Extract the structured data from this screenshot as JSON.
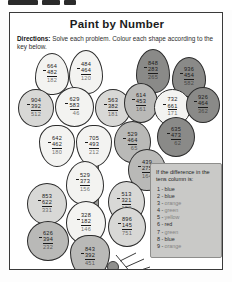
{
  "worksheet": {
    "title": "Paint by Number",
    "directions_label": "Directions:",
    "directions_text": "Solve each problem. Colour each shape according to the key below."
  },
  "key": {
    "heading": "If the difference in the tens column is:",
    "entries": [
      {
        "number": "1 -",
        "color": "blue"
      },
      {
        "number": "2 -",
        "color": "blue"
      },
      {
        "number": "3 -",
        "color": "orange"
      },
      {
        "number": "4 -",
        "color": "green"
      },
      {
        "number": "5 -",
        "color": "yellow"
      },
      {
        "number": "6 -",
        "color": "red"
      },
      {
        "number": "7 -",
        "color": "green"
      },
      {
        "number": "8 -",
        "color": "blue"
      },
      {
        "number": "9 -",
        "color": "orange"
      }
    ]
  },
  "petals": [
    {
      "id": "p1",
      "top": "664",
      "sub": "482",
      "ans": "182",
      "tone": "t-white"
    },
    {
      "id": "p2",
      "top": "484",
      "sub": "464",
      "ans": "120",
      "tone": "t-white"
    },
    {
      "id": "p3",
      "top": "848",
      "sub": "283",
      "ans": "265",
      "tone": "t-dgray"
    },
    {
      "id": "p4",
      "top": "936",
      "sub": "454",
      "ans": "582",
      "tone": "t-dgray"
    },
    {
      "id": "p5",
      "top": "904",
      "sub": "392",
      "ans": "512",
      "tone": "t-lgray"
    },
    {
      "id": "p6",
      "top": "629",
      "sub": "583",
      "ans": "46",
      "tone": "t-white"
    },
    {
      "id": "p7",
      "top": "563",
      "sub": "382",
      "ans": "181",
      "tone": "t-lgray"
    },
    {
      "id": "p8",
      "top": "614",
      "sub": "453",
      "ans": "161",
      "tone": "t-mgray"
    },
    {
      "id": "p9",
      "top": "732",
      "sub": "661",
      "ans": "171",
      "tone": "t-white"
    },
    {
      "id": "p10",
      "top": "926",
      "sub": "464",
      "ans": "362",
      "tone": "t-dgray"
    },
    {
      "id": "p11",
      "top": "642",
      "sub": "462",
      "ans": "180",
      "tone": "t-white"
    },
    {
      "id": "p12",
      "top": "705",
      "sub": "493",
      "ans": "212",
      "tone": "t-white"
    },
    {
      "id": "p13",
      "top": "529",
      "sub": "464",
      "ans": "65",
      "tone": "t-mgray"
    },
    {
      "id": "p14",
      "top": "635",
      "sub": "473",
      "ans": "62",
      "tone": "t-dgray"
    },
    {
      "id": "p15",
      "top": "439",
      "sub": "275",
      "ans": "164",
      "tone": "t-mgray"
    },
    {
      "id": "p16",
      "top": "529",
      "sub": "373",
      "ans": "156",
      "tone": "t-white"
    },
    {
      "id": "p17",
      "top": "853",
      "sub": "622",
      "ans": "331",
      "tone": "t-lgray"
    },
    {
      "id": "p18",
      "top": "513",
      "sub": "321",
      "ans": "192",
      "tone": "t-lgray"
    },
    {
      "id": "p19",
      "top": "328",
      "sub": "182",
      "ans": "146",
      "tone": "t-white"
    },
    {
      "id": "p20",
      "top": "896",
      "sub": "145",
      "ans": "751",
      "tone": "t-lgray"
    },
    {
      "id": "p21",
      "top": "626",
      "sub": "394",
      "ans": "232",
      "tone": "t-mgray"
    },
    {
      "id": "p22",
      "top": "843",
      "sub": "392",
      "ans": "451",
      "tone": "t-mgray"
    }
  ]
}
